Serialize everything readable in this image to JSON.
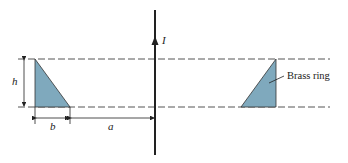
{
  "diagram": {
    "labels": {
      "current": "I",
      "height": "h",
      "width": "b",
      "distance": "a",
      "ring": "Brass ring"
    },
    "colors": {
      "ring_fill": "#7fa9bd",
      "line": "#222222",
      "dash": "#555555"
    }
  }
}
